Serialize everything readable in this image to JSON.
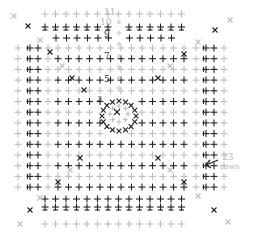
{
  "diagram": {
    "colors": {
      "dark": "#222222",
      "light": "#bdbdbd",
      "label": "#b0b0b0",
      "background": "#ffffff"
    },
    "grid": {
      "cols_x": [
        22,
        33,
        44,
        56,
        67,
        77,
        88,
        98,
        109,
        119,
        130,
        140,
        151,
        161,
        172,
        182,
        193,
        204,
        214,
        224
      ],
      "rows_y": [
        14,
        25,
        35,
        47,
        58,
        68,
        79,
        89,
        100,
        110,
        121,
        131,
        142,
        152,
        163,
        173,
        184,
        194,
        205,
        215,
        226
      ]
    },
    "row_count_label": {
      "number": "23",
      "unit": "rows"
    },
    "round_numbers": [
      {
        "text": "11",
        "x": 109,
        "y": 9
      },
      {
        "text": "10",
        "x": 104,
        "y": 19
      },
      {
        "text": "9",
        "x": 108,
        "y": 31
      },
      {
        "text": "7",
        "x": 108,
        "y": 54
      },
      {
        "text": "5",
        "x": 108,
        "y": 76
      },
      {
        "text": "3",
        "x": 100,
        "y": 96
      }
    ],
    "legend_note": "23 rows"
  }
}
